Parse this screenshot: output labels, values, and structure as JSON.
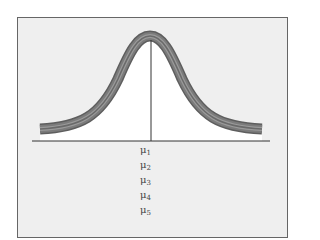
{
  "figure": {
    "type": "overlapping-normal-curves",
    "curves_count": 5,
    "background_color": "#eeeeee",
    "frame_color": "#555555",
    "curve_colors": [
      "#6d6d6d",
      "#8a8a8a",
      "#a0a0a0",
      "#7b7b7b",
      "#5e5e5e"
    ],
    "axis_color": "#333333",
    "mean_line_color": "#333333"
  },
  "labels": [
    {
      "symbol": "μ",
      "sub": "1"
    },
    {
      "symbol": "μ",
      "sub": "2"
    },
    {
      "symbol": "μ",
      "sub": "3"
    },
    {
      "symbol": "μ",
      "sub": "4"
    },
    {
      "symbol": "μ",
      "sub": "5"
    }
  ]
}
